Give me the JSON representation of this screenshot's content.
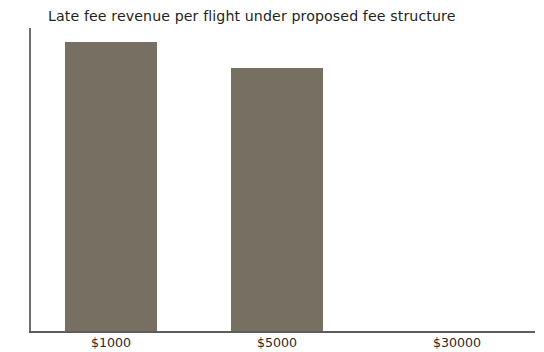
{
  "chart_data": {
    "type": "bar",
    "title": "Late fee revenue per flight under proposed fee structure",
    "xlabel": "",
    "ylabel": "",
    "categories": [
      "$1000",
      "$5000",
      "$30000"
    ],
    "values": [
      100,
      91,
      0
    ],
    "ylim": [
      0,
      105
    ],
    "grid": false,
    "legend": null,
    "bar_color": "#766f62",
    "axis_color": "#5d5d5d",
    "background_color": "#ffffff",
    "series": [
      {
        "name": "Late fee revenue per flight",
        "values": [
          100,
          91,
          0
        ]
      }
    ],
    "bars": [
      {
        "category": "$1000",
        "value": 100,
        "center_x": 111,
        "width": 92
      },
      {
        "category": "$5000",
        "value": 91,
        "center_x": 277,
        "width": 92
      },
      {
        "category": "$30000",
        "value": 0,
        "center_x": 457,
        "width": 92
      }
    ]
  }
}
